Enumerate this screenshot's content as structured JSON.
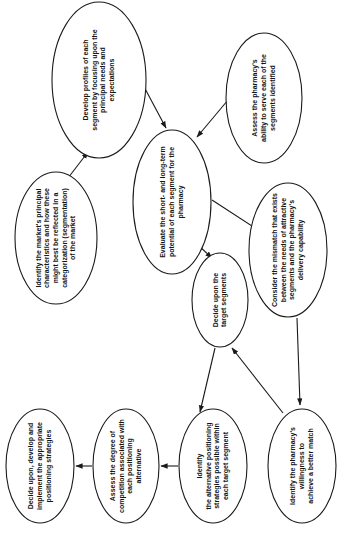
{
  "diagram": {
    "orientation": "rotated-90-clockwise",
    "background_color": "#ffffff",
    "line_color": "#1a1a1a",
    "text_color": "#141414",
    "nodes": [
      {
        "id": "develop-profiles",
        "lines": [
          "Develop profiles of each",
          "segment by focusing upon the",
          "principal needs and",
          "expectations"
        ],
        "cx": 99,
        "cy": 80,
        "rx": 47,
        "ry": 78,
        "font_size": 7.0,
        "line_gap": 8.6
      },
      {
        "id": "assess-ability",
        "lines": [
          "Assess the pharmacy's",
          "ability to serve each of the",
          "segments identified"
        ],
        "cx": 264,
        "cy": 98,
        "rx": 38,
        "ry": 65,
        "font_size": 7.0,
        "line_gap": 8.6
      },
      {
        "id": "evaluate-potential",
        "lines": [
          "Evaluate the short- and long-term",
          "potential of each segment for the",
          "pharmacy"
        ],
        "cx": 172,
        "cy": 202,
        "rx": 39,
        "ry": 72,
        "font_size": 7.0,
        "line_gap": 8.6
      },
      {
        "id": "identify-market",
        "lines": [
          "Identify the market's principal",
          "characteristics and how these",
          "might best be reflected in a",
          "categorization (segmentation)",
          "of the market"
        ],
        "cx": 56,
        "cy": 238,
        "rx": 41,
        "ry": 66,
        "font_size": 7.0,
        "line_gap": 8.6
      },
      {
        "id": "consider-mismatch",
        "lines": [
          "Consider the mismatch that exists",
          "between the needs of attractive",
          "segments and the pharmacy's",
          "delivery capability"
        ],
        "cx": 288,
        "cy": 250,
        "rx": 39,
        "ry": 67,
        "font_size": 7.0,
        "line_gap": 8.6
      },
      {
        "id": "decide-target-segments",
        "lines": [
          "Decide upon the",
          "target segments"
        ],
        "cx": 220,
        "cy": 300,
        "rx": 28,
        "ry": 47,
        "font_size": 7.0,
        "line_gap": 8.6
      },
      {
        "id": "decide-implement-positioning",
        "lines": [
          "Decide upon, develop and",
          "implement the appropriate",
          "positioning strategies"
        ],
        "cx": 40,
        "cy": 466,
        "rx": 34,
        "ry": 57,
        "font_size": 7.0,
        "line_gap": 8.6
      },
      {
        "id": "assess-competition",
        "lines": [
          "Assess the degree of",
          "competition associated with",
          "each positioning",
          "alternative"
        ],
        "cx": 126,
        "cy": 466,
        "rx": 33,
        "ry": 57,
        "font_size": 7.0,
        "line_gap": 8.6
      },
      {
        "id": "identify-alternative-positioning",
        "lines": [
          "Identify",
          "the alternative positioning",
          "strategies possible within",
          "each target segment"
        ],
        "cx": 213,
        "cy": 466,
        "rx": 34,
        "ry": 57,
        "font_size": 7.0,
        "line_gap": 8.6
      },
      {
        "id": "identify-willingness",
        "lines": [
          "Identify the pharmacy's",
          "willingness to",
          "achieve a better match"
        ],
        "cx": 302,
        "cy": 466,
        "rx": 34,
        "ry": 57,
        "font_size": 7.0,
        "line_gap": 8.6
      }
    ],
    "edges": [
      {
        "id": "edge-identify-market-to-develop-profiles",
        "from": "identify-market",
        "to": "develop-profiles",
        "x1": 68,
        "y1": 178,
        "x2": 88,
        "y2": 152
      },
      {
        "id": "edge-develop-profiles-to-evaluate",
        "from": "develop-profiles",
        "to": "evaluate-potential",
        "x1": 142,
        "y1": 83,
        "x2": 166,
        "y2": 128
      },
      {
        "id": "edge-assess-ability-to-evaluate",
        "from": "assess-ability",
        "to": "evaluate-potential",
        "x1": 228,
        "y1": 100,
        "x2": 197,
        "y2": 137
      },
      {
        "id": "edge-evaluate-to-consider-mismatch",
        "from": "evaluate-potential",
        "to": "consider-mismatch",
        "x1": 212,
        "y1": 200,
        "x2": 258,
        "y2": 230
      },
      {
        "id": "edge-evaluate-to-decide-target",
        "from": "evaluate-potential",
        "to": "decide-target-segments",
        "x1": 198,
        "y1": 245,
        "x2": 212,
        "y2": 258
      },
      {
        "id": "edge-consider-mismatch-to-identify-willingness",
        "from": "consider-mismatch",
        "to": "identify-willingness",
        "x1": 297,
        "y1": 318,
        "x2": 300,
        "y2": 405
      },
      {
        "id": "edge-decide-target-to-identify-alternative",
        "from": "decide-target-segments",
        "to": "identify-alternative-positioning",
        "x1": 215,
        "y1": 348,
        "x2": 200,
        "y2": 412
      },
      {
        "id": "edge-identify-willingness-to-decide-target",
        "from": "identify-willingness",
        "to": "decide-target-segments",
        "x1": 283,
        "y1": 413,
        "x2": 232,
        "y2": 348
      },
      {
        "id": "edge-identify-alternative-to-assess-competition",
        "from": "identify-alternative-positioning",
        "to": "assess-competition",
        "x1": 178,
        "y1": 466,
        "x2": 161,
        "y2": 466
      },
      {
        "id": "edge-assess-competition-to-decide-implement",
        "from": "assess-competition",
        "to": "decide-implement-positioning",
        "x1": 92,
        "y1": 466,
        "x2": 76,
        "y2": 466
      }
    ]
  }
}
